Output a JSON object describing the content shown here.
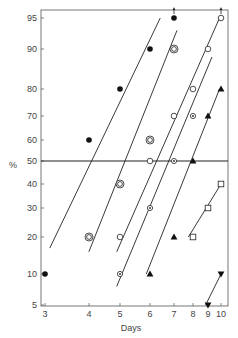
{
  "chart_data": {
    "type": "scatter",
    "title": "",
    "xlabel": "Days",
    "ylabel": "%",
    "x_scale": "log",
    "y_scale": "probability",
    "xlim": [
      3,
      10
    ],
    "ylim": [
      5,
      95
    ],
    "x_ticks": [
      3,
      4,
      5,
      6,
      7,
      8,
      9,
      10
    ],
    "y_ticks": [
      5,
      10,
      20,
      30,
      40,
      50,
      60,
      70,
      80,
      90,
      95
    ],
    "grid": false,
    "reference_line": {
      "y": 50,
      "label": "50% line"
    },
    "legend": null,
    "series": [
      {
        "name": "filled-circle",
        "marker": "filled-circle",
        "points": [
          [
            3,
            10
          ],
          [
            4,
            60
          ],
          [
            5,
            80
          ],
          [
            6,
            90
          ],
          [
            7,
            95
          ]
        ],
        "arrow_up_at": [
          7
        ],
        "fit_line": [
          [
            3.1,
            17
          ],
          [
            6.6,
            95
          ]
        ]
      },
      {
        "name": "double-circle",
        "marker": "double-circle",
        "points": [
          [
            4,
            20
          ],
          [
            5,
            40
          ],
          [
            6,
            60
          ],
          [
            7,
            90
          ]
        ],
        "fit_line": [
          [
            4.05,
            16
          ],
          [
            7.4,
            93
          ]
        ]
      },
      {
        "name": "open-circle",
        "marker": "open-circle",
        "points": [
          [
            5,
            20
          ],
          [
            6,
            50
          ],
          [
            7,
            70
          ],
          [
            8,
            80
          ],
          [
            9,
            90
          ],
          [
            10,
            95
          ]
        ],
        "arrow_up_at": [
          10
        ],
        "fit_line": [
          [
            4.9,
            16
          ],
          [
            9.9,
            95
          ]
        ]
      },
      {
        "name": "dotted-circle",
        "marker": "dotted-circle",
        "points": [
          [
            5,
            10
          ],
          [
            6,
            30
          ],
          [
            7,
            50
          ],
          [
            8,
            70
          ]
        ],
        "fit_line": [
          [
            4.9,
            8
          ],
          [
            9.4,
            88
          ]
        ]
      },
      {
        "name": "filled-triangle-up",
        "marker": "filled-triangle-up",
        "points": [
          [
            6,
            10
          ],
          [
            7,
            20
          ],
          [
            8,
            50
          ],
          [
            9,
            70
          ],
          [
            10,
            80
          ]
        ],
        "fit_line": [
          [
            6,
            10
          ],
          [
            9.9,
            80
          ]
        ]
      },
      {
        "name": "open-square",
        "marker": "open-square",
        "points": [
          [
            8,
            20
          ],
          [
            9,
            30
          ],
          [
            10,
            40
          ]
        ],
        "fit_line": [
          [
            8,
            20
          ],
          [
            10,
            40
          ]
        ]
      },
      {
        "name": "filled-triangle-down",
        "marker": "filled-triangle-down",
        "points": [
          [
            9,
            5
          ],
          [
            10,
            10
          ]
        ],
        "fit_line": [
          [
            9,
            5
          ],
          [
            10,
            10
          ]
        ]
      }
    ]
  },
  "axes": {
    "x_title": "Days",
    "y_title": "%",
    "x_tick_labels": [
      "3",
      "4",
      "5",
      "6",
      "7",
      "8",
      "9",
      "10"
    ],
    "y_tick_labels": [
      "5",
      "10",
      "20",
      "30",
      "40",
      "50",
      "60",
      "70",
      "80",
      "90",
      "95"
    ]
  }
}
